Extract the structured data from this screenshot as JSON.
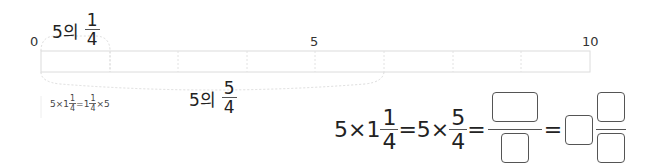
{
  "number_line": {
    "ticks": [
      {
        "label": "0",
        "x": 30
      },
      {
        "label": "5",
        "x": 311
      },
      {
        "label": "10",
        "x": 582
      }
    ],
    "segments": 8,
    "start": 0,
    "end": 10
  },
  "top_label": {
    "prefix": "5의",
    "numerator": "1",
    "denominator": "4"
  },
  "bottom_label": {
    "prefix": "5의",
    "numerator": "5",
    "denominator": "4"
  },
  "note": {
    "a": "5×1",
    "n1": "1",
    "d1": "4",
    "b": "=1",
    "n2": "1",
    "d2": "4",
    "c": "×5"
  },
  "equation": {
    "p1": "5×1",
    "mixed_num": "1",
    "mixed_den": "4",
    "eq1": "=5×",
    "frac_num": "5",
    "frac_den": "4",
    "eq2": "=",
    "eq3": "="
  },
  "colors": {
    "line": "#dcdcdc",
    "box_border": "#555555"
  }
}
